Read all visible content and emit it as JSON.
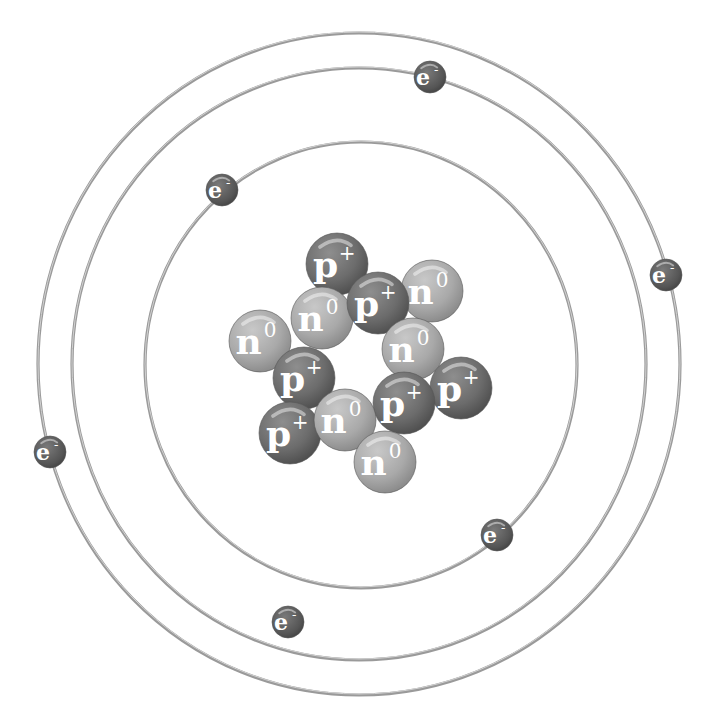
{
  "diagram": {
    "colors": {
      "background": "#ffffff",
      "orbit": "#9a9a9a",
      "proton": "#6c6c6c",
      "neutron": "#a9a9a9",
      "electron": "#5a5a5a",
      "label": "#ffffff"
    },
    "orbits": [
      {
        "name": "inner",
        "cx": 361,
        "cy": 365,
        "rx": 216,
        "ry": 223
      },
      {
        "name": "middle",
        "cx": 359,
        "cy": 364,
        "rx": 287,
        "ry": 296
      },
      {
        "name": "outer",
        "cx": 359,
        "cy": 364,
        "rx": 321,
        "ry": 331
      }
    ],
    "nucleus": [
      {
        "type": "proton",
        "symbol": "p",
        "charge": "+",
        "cx": 337,
        "cy": 264
      },
      {
        "type": "neutron",
        "symbol": "n",
        "charge": "0",
        "cx": 432,
        "cy": 291
      },
      {
        "type": "neutron",
        "symbol": "n",
        "charge": "0",
        "cx": 260,
        "cy": 341
      },
      {
        "type": "neutron",
        "symbol": "n",
        "charge": "0",
        "cx": 322,
        "cy": 318
      },
      {
        "type": "proton",
        "symbol": "p",
        "charge": "+",
        "cx": 378,
        "cy": 303
      },
      {
        "type": "neutron",
        "symbol": "n",
        "charge": "0",
        "cx": 413,
        "cy": 349
      },
      {
        "type": "proton",
        "symbol": "p",
        "charge": "+",
        "cx": 304,
        "cy": 378
      },
      {
        "type": "proton",
        "symbol": "p",
        "charge": "+",
        "cx": 461,
        "cy": 388
      },
      {
        "type": "proton",
        "symbol": "p",
        "charge": "+",
        "cx": 404,
        "cy": 403
      },
      {
        "type": "proton",
        "symbol": "p",
        "charge": "+",
        "cx": 290,
        "cy": 433
      },
      {
        "type": "neutron",
        "symbol": "n",
        "charge": "0",
        "cx": 345,
        "cy": 420
      },
      {
        "type": "neutron",
        "symbol": "n",
        "charge": "0",
        "cx": 385,
        "cy": 462
      }
    ],
    "electrons": [
      {
        "symbol": "e",
        "charge": "-",
        "orbit": "inner",
        "cx": 222,
        "cy": 190
      },
      {
        "symbol": "e",
        "charge": "-",
        "orbit": "inner",
        "cx": 497,
        "cy": 535
      },
      {
        "symbol": "e",
        "charge": "-",
        "orbit": "middle",
        "cx": 430,
        "cy": 77
      },
      {
        "symbol": "e",
        "charge": "-",
        "orbit": "middle",
        "cx": 288,
        "cy": 622
      },
      {
        "symbol": "e",
        "charge": "-",
        "orbit": "outer",
        "cx": 666,
        "cy": 275
      },
      {
        "symbol": "e",
        "charge": "-",
        "orbit": "outer",
        "cx": 50,
        "cy": 452
      }
    ],
    "counts": {
      "protons": 6,
      "neutrons": 6,
      "electrons": 6
    }
  }
}
